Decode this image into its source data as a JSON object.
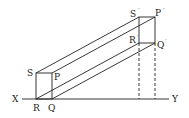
{
  "diagram": {
    "type": "projection-of-prism",
    "axis": {
      "left_label": "X",
      "right_label": "Y"
    },
    "front_face_labels": {
      "S": "S",
      "P": "P",
      "R": "R",
      "Q": "Q"
    },
    "back_face_labels": {
      "S_prime": "S",
      "P_prime": "P",
      "R_prime": "R",
      "Q_prime": "Q",
      "prime_mark": "´"
    },
    "line_color": "#222222"
  }
}
